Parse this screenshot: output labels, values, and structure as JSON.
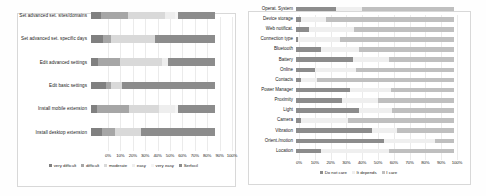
{
  "chart_data": [
    {
      "id": "left",
      "type": "bar",
      "orientation": "horizontal",
      "stacked": true,
      "stacked_percent": true,
      "title": "",
      "xlabel": "",
      "ylabel": "",
      "xlim": [
        0,
        100
      ],
      "grid": true,
      "legend_position": "bottom",
      "tick_labels": [
        "0%",
        "10%",
        "20%",
        "30%",
        "40%",
        "50%",
        "60%",
        "70%",
        "80%",
        "90%",
        "100%"
      ],
      "tick_values": [
        0,
        10,
        20,
        30,
        40,
        50,
        60,
        70,
        80,
        90,
        100
      ],
      "categories": [
        "Set advanced set. sites/domains",
        "Set advanced set. specific days",
        "Edit advanced settings",
        "Edit basic settings",
        "Install mobile extension",
        "Install desktop extension"
      ],
      "series": [
        {
          "name": "very difficult",
          "color": "#808080",
          "values": [
            8,
            10,
            6,
            12,
            5,
            9
          ]
        },
        {
          "name": "difficult",
          "color": "#a6a6a6",
          "values": [
            22,
            6,
            17,
            4,
            26,
            10
          ]
        },
        {
          "name": "moderate",
          "color": "#d9d9d9",
          "values": [
            30,
            36,
            34,
            9,
            24,
            21
          ]
        },
        {
          "name": "easy",
          "color": "#eeeeee",
          "values": [
            8,
            0,
            5,
            0,
            13,
            0
          ]
        },
        {
          "name": "very easy",
          "color": "#f5f5f5",
          "values": [
            2,
            0,
            0,
            0,
            2,
            0
          ]
        },
        {
          "name": "Serfocil",
          "color": "#8c8c8c",
          "values": [
            30,
            48,
            38,
            75,
            30,
            60
          ]
        }
      ]
    },
    {
      "id": "right",
      "type": "bar",
      "orientation": "horizontal",
      "stacked": true,
      "stacked_percent": true,
      "title": "",
      "xlabel": "",
      "ylabel": "",
      "xlim": [
        0,
        100
      ],
      "grid": true,
      "legend_position": "bottom",
      "tick_labels": [
        "0%",
        "10%",
        "20%",
        "30%",
        "40%",
        "50%",
        "60%",
        "70%",
        "80%",
        "90%",
        "100%"
      ],
      "tick_values": [
        0,
        10,
        20,
        30,
        40,
        50,
        60,
        70,
        80,
        90,
        100
      ],
      "categories": [
        "Operat. System",
        "Device storage",
        "Web notificat.",
        "Connection type",
        "Bluetooth",
        "Battery",
        "Online",
        "Contacts",
        "Power Manager",
        "Proximity",
        "Light",
        "Camera",
        "Vibration",
        "Orient./motion",
        "Location"
      ],
      "series": [
        {
          "name": "Do not care",
          "color": "#8c8c8c",
          "values": [
            25,
            3,
            8,
            1,
            16,
            36,
            12,
            3,
            34,
            29,
            40,
            3,
            48,
            56,
            16
          ]
        },
        {
          "name": "It depends",
          "color": "#efefef",
          "values": [
            17,
            16,
            29,
            27,
            24,
            23,
            26,
            10,
            26,
            23,
            21,
            30,
            16,
            32,
            43
          ]
        },
        {
          "name": "I care",
          "color": "#bfbfbf",
          "values": [
            58,
            81,
            63,
            72,
            60,
            41,
            62,
            87,
            40,
            48,
            39,
            67,
            36,
            12,
            41
          ]
        }
      ]
    }
  ]
}
